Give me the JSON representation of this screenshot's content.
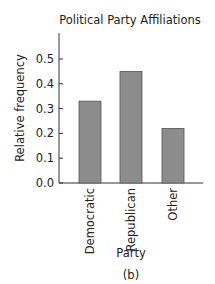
{
  "chart_data": {
    "type": "bar",
    "title": "Political Party Affiliations",
    "xlabel": "Party",
    "ylabel": "Relative frequency",
    "caption": "(b)",
    "categories": [
      "Democratic",
      "Republican",
      "Other"
    ],
    "values": [
      0.33,
      0.45,
      0.22
    ],
    "ylim": [
      0,
      0.58
    ],
    "yticks": [
      0.0,
      0.1,
      0.2,
      0.3,
      0.4,
      0.5
    ],
    "ytick_labels": [
      "0.0",
      "0.1",
      "0.2",
      "0.3",
      "0.4",
      "0.5"
    ],
    "grid": false,
    "legend": null,
    "bar_color": "#8c8c8c",
    "bar_edge_color": "#555555"
  }
}
